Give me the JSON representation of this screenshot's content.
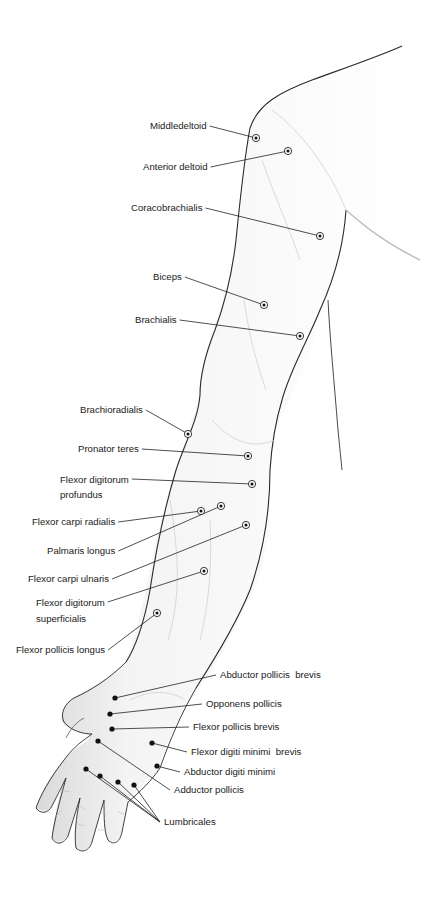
{
  "figure": {
    "type": "anatomical-diagram",
    "colors": {
      "outline": "#2a2a2a",
      "shade": "#c8c8c8",
      "leader": "#222222",
      "text": "#1a1a1a",
      "background": "#ffffff"
    }
  },
  "labels": [
    {
      "id": "middle-deltoid",
      "text": "Middledeltoid",
      "x": 150,
      "y": 126,
      "align": "left",
      "point": [
        256,
        138
      ]
    },
    {
      "id": "anterior-deltoid",
      "text": "Anterior deltoid",
      "x": 143,
      "y": 167,
      "align": "left",
      "point": [
        288,
        151
      ]
    },
    {
      "id": "coracobrachialis",
      "text": "Coracobrachialis",
      "x": 131,
      "y": 208,
      "align": "left",
      "point": [
        320,
        236
      ]
    },
    {
      "id": "biceps",
      "text": "Biceps",
      "x": 153,
      "y": 277,
      "align": "left",
      "point": [
        264,
        305
      ]
    },
    {
      "id": "brachialis",
      "text": "Brachialis",
      "x": 135,
      "y": 320,
      "align": "left",
      "point": [
        300,
        336
      ]
    },
    {
      "id": "brachioradialis",
      "text": "Brachioradialis",
      "x": 80,
      "y": 410,
      "align": "left",
      "point": [
        188,
        434
      ]
    },
    {
      "id": "pronator-teres",
      "text": "Pronator teres",
      "x": 78,
      "y": 443,
      "align": "left",
      "point": [
        248,
        456
      ]
    },
    {
      "id": "flexor-digitorum-profundus",
      "text": "Flexor digitorum\nprofundus",
      "x": 60,
      "y": 472,
      "align": "left",
      "point": [
        252,
        484
      ]
    },
    {
      "id": "flexor-carpi-radialis",
      "text": "Flexor carpi radialis",
      "x": 32,
      "y": 516,
      "align": "left",
      "point": [
        201,
        511
      ]
    },
    {
      "id": "palmaris-longus",
      "text": "Palmaris longus",
      "x": 47,
      "y": 546,
      "align": "left",
      "point": [
        221,
        506
      ]
    },
    {
      "id": "flexor-carpi-ulnaris",
      "text": "Flexor carpi ulnaris",
      "x": 28,
      "y": 573,
      "align": "left",
      "point": [
        246,
        525
      ]
    },
    {
      "id": "flexor-digitorum-superficialis",
      "text": "Flexor digitorum\nsuperficialis",
      "x": 36,
      "y": 596,
      "align": "left",
      "point": [
        204,
        571
      ]
    },
    {
      "id": "flexor-pollicis-longus",
      "text": "Flexor pollicis longus",
      "x": 16,
      "y": 643,
      "align": "left",
      "point": [
        157,
        613
      ]
    },
    {
      "id": "abductor-pollicis-brevis",
      "text": "Abductor pollicis  brevis",
      "x": 220,
      "y": 668,
      "align": "left",
      "point": [
        115,
        698
      ]
    },
    {
      "id": "opponens-pollicis",
      "text": "Opponens pollicis",
      "x": 206,
      "y": 697,
      "align": "left",
      "point": [
        110,
        714
      ]
    },
    {
      "id": "flexor-pollicis-brevis",
      "text": "Flexor pollicis brevis",
      "x": 193,
      "y": 720,
      "align": "left",
      "point": [
        112,
        729
      ]
    },
    {
      "id": "flexor-digiti-minimi-brevis",
      "text": "Flexor digiti minimi  brevis",
      "x": 191,
      "y": 746,
      "align": "left",
      "point": [
        152,
        743
      ]
    },
    {
      "id": "abductor-digiti-minimi",
      "text": "Abductor digiti minimi",
      "x": 184,
      "y": 765,
      "align": "left",
      "point": [
        157,
        766
      ]
    },
    {
      "id": "adductor-pollicis",
      "text": "Adductor pollicis",
      "x": 174,
      "y": 783,
      "align": "left",
      "point": [
        98,
        741
      ]
    },
    {
      "id": "lumbricales",
      "text": "Lumbricales",
      "x": 164,
      "y": 815,
      "align": "left",
      "points": [
        [
          86,
          769
        ],
        [
          100,
          776
        ],
        [
          118,
          782
        ],
        [
          134,
          785
        ]
      ]
    }
  ]
}
